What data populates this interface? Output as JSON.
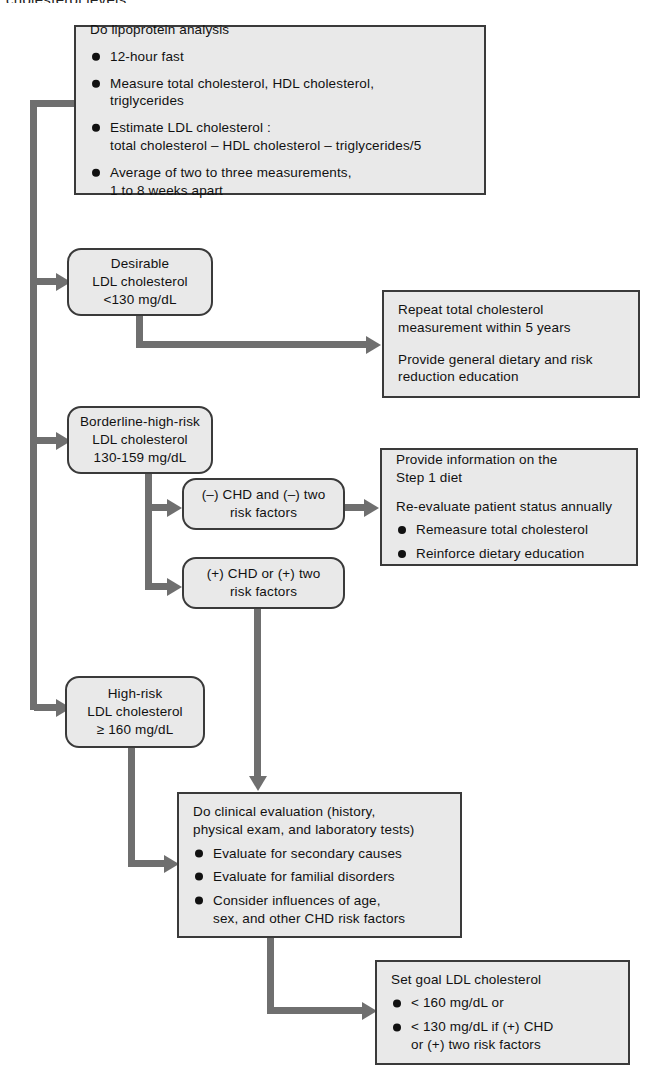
{
  "page": {
    "cropped_caption_top": "cholesterol levels.",
    "width": 652,
    "height": 1083
  },
  "colors": {
    "box_fill": "#e9e9e9",
    "box_border": "#3a3a3a",
    "connector": "#6f6f6f",
    "text": "#111111",
    "background": "#ffffff"
  },
  "flowchart": {
    "type": "flowchart",
    "orientation": "top-to-bottom",
    "nodes": [
      {
        "id": "lipoprotein-analysis",
        "shape": "rectangle",
        "title": "Do lipoprotein analysis",
        "bullets": [
          "12-hour fast",
          "Measure total cholesterol, HDL cholesterol,\ntriglycerides",
          "Estimate LDL cholesterol :\ntotal cholesterol – HDL cholesterol – triglycerides/5",
          "Average of two to three measurements,\n1 to 8 weeks apart"
        ]
      },
      {
        "id": "desirable",
        "shape": "rounded",
        "text": "Desirable\nLDL cholesterol\n<130 mg/dL"
      },
      {
        "id": "borderline-high-risk",
        "shape": "rounded",
        "text": "Borderline-high-risk\nLDL cholesterol\n130-159 mg/dL"
      },
      {
        "id": "high-risk",
        "shape": "rounded",
        "text": "High-risk\nLDL cholesterol\n≥ 160 mg/dL"
      },
      {
        "id": "repeat-total-cholesterol",
        "shape": "rectangle",
        "paragraphs": [
          "Repeat total cholesterol\nmeasurement within 5 years",
          "Provide general dietary and risk\nreduction education"
        ]
      },
      {
        "id": "chd-negative",
        "shape": "rounded",
        "text": "(–) CHD and (–) two\nrisk factors"
      },
      {
        "id": "chd-positive",
        "shape": "rounded",
        "text": "(+) CHD or (+) two\nrisk factors"
      },
      {
        "id": "step-1-diet",
        "shape": "rectangle",
        "paragraphs": [
          "Provide information on the\nStep 1 diet",
          "Re-evaluate patient status annually"
        ],
        "bullets": [
          "Remeasure total cholesterol",
          "Reinforce dietary education"
        ]
      },
      {
        "id": "clinical-evaluation",
        "shape": "rectangle",
        "title": "Do clinical evaluation (history,\nphysical exam, and laboratory tests)",
        "bullets": [
          "Evaluate for secondary causes",
          "Evaluate for familial disorders",
          "Consider influences of age,\nsex, and other CHD risk factors"
        ]
      },
      {
        "id": "set-goal-ldl",
        "shape": "rectangle",
        "title": "Set goal LDL cholesterol",
        "bullets": [
          "< 160 mg/dL or",
          "< 130 mg/dL if (+) CHD\nor (+) two risk factors"
        ]
      }
    ],
    "edges": [
      {
        "from": "lipoprotein-analysis",
        "to": "desirable"
      },
      {
        "from": "lipoprotein-analysis",
        "to": "borderline-high-risk"
      },
      {
        "from": "lipoprotein-analysis",
        "to": "high-risk"
      },
      {
        "from": "desirable",
        "to": "repeat-total-cholesterol"
      },
      {
        "from": "borderline-high-risk",
        "to": "chd-negative"
      },
      {
        "from": "borderline-high-risk",
        "to": "chd-positive"
      },
      {
        "from": "chd-negative",
        "to": "step-1-diet"
      },
      {
        "from": "chd-positive",
        "to": "clinical-evaluation"
      },
      {
        "from": "high-risk",
        "to": "clinical-evaluation"
      },
      {
        "from": "clinical-evaluation",
        "to": "set-goal-ldl"
      }
    ]
  }
}
